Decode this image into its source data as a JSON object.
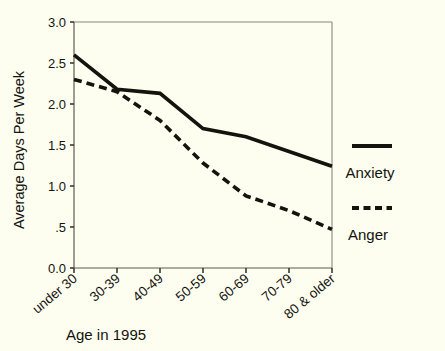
{
  "chart_data": {
    "type": "line",
    "title": "",
    "xlabel": "Age in 1995",
    "ylabel": "Average Days Per Week",
    "categories": [
      "under 30",
      "30-39",
      "40-49",
      "50-59",
      "60-69",
      "70-79",
      "80 & older"
    ],
    "series": [
      {
        "name": "Anxiety",
        "style": "solid",
        "values": [
          2.6,
          2.18,
          2.13,
          1.7,
          1.6,
          1.42,
          1.24
        ]
      },
      {
        "name": "Anger",
        "style": "dashed",
        "values": [
          2.3,
          2.15,
          1.8,
          1.28,
          0.88,
          0.7,
          0.47
        ]
      }
    ],
    "ylim": [
      0.0,
      3.0
    ],
    "ytick_values": [
      0.0,
      0.5,
      1.0,
      1.5,
      2.0,
      2.5,
      3.0
    ],
    "ytick_labels": [
      "0.0",
      ".5",
      "1.0",
      "1.5",
      "2.0",
      "2.5",
      "3.0"
    ],
    "grid": false,
    "legend_position": "right",
    "legend_entries": [
      "Anxiety",
      "Anger"
    ],
    "colors": {
      "line": "#14140e",
      "background": "#fdfdf0",
      "axis": "#5c5c50"
    }
  },
  "axes": {
    "y_axis_title": "Average Days Per Week",
    "x_axis_title": "Age in 1995"
  },
  "legend": {
    "anxiety_label": "Anxiety",
    "anger_label": "Anger"
  }
}
